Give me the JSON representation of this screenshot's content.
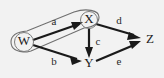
{
  "figure": {
    "kind": "directed-graph",
    "background_color": "#f2f2f2",
    "stroke_color": "#1a1a1a",
    "outline_color": "#6f6f6f",
    "width": 164,
    "height": 78
  },
  "nodes": [
    {
      "id": "W",
      "label": "W",
      "x": 24,
      "y": 42,
      "circled": true
    },
    {
      "id": "X",
      "label": "X",
      "x": 89,
      "y": 20,
      "circled": true
    },
    {
      "id": "Y",
      "label": "Y",
      "x": 89,
      "y": 64,
      "circled": false
    },
    {
      "id": "Z",
      "label": "Z",
      "x": 150,
      "y": 40,
      "circled": false
    }
  ],
  "edges": [
    {
      "id": "a",
      "label": "a",
      "from": "W",
      "to": "X",
      "label_x": 54,
      "label_y": 22
    },
    {
      "id": "b",
      "label": "b",
      "from": "W",
      "to": "Y",
      "label_x": 54,
      "label_y": 62
    },
    {
      "id": "c",
      "label": "c",
      "from": "X",
      "to": "Y",
      "label_x": 98,
      "label_y": 42
    },
    {
      "id": "d",
      "label": "d",
      "from": "X",
      "to": "Z",
      "label_x": 119,
      "label_y": 21
    },
    {
      "id": "e",
      "label": "e",
      "from": "Y",
      "to": "Z",
      "label_x": 119,
      "label_y": 62
    }
  ],
  "group": {
    "id": "WX",
    "members": [
      "W",
      "X"
    ],
    "shape": "rounded-capsule",
    "note": "oval outline enclosing node W, node X and edge a"
  }
}
